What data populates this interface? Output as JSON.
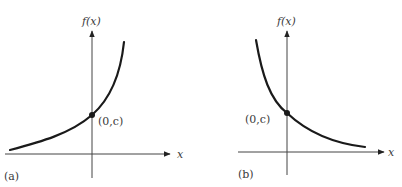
{
  "figure": {
    "panels": [
      {
        "id": "a",
        "label": "(a)",
        "y_axis_label": "f(x)",
        "x_axis_label": "x",
        "point_label": "(0,c)",
        "description": "increasing exponential curve through (0,c)"
      },
      {
        "id": "b",
        "label": "(b)",
        "y_axis_label": "f(x)",
        "x_axis_label": "x",
        "point_label": "(0,c)",
        "description": "decreasing exponential curve through (0,c)"
      }
    ],
    "colors": {
      "curve": "#1a1a1a",
      "axis": "#444444",
      "text": "#3a3a3a",
      "background": "#ffffff"
    }
  }
}
